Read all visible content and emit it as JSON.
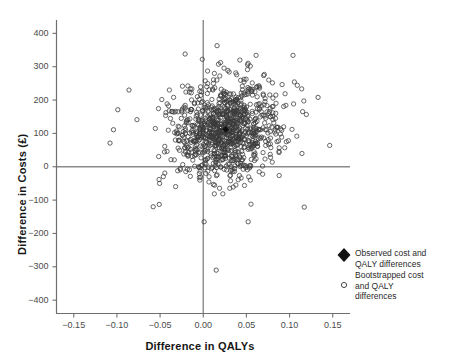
{
  "chart_data": {
    "type": "scatter",
    "title": "",
    "xlabel": "Difference in QALYs",
    "ylabel": "Difference in Costs (£)",
    "xlim": [
      -0.17,
      0.17
    ],
    "ylim": [
      -440,
      440
    ],
    "xticks": [
      -0.15,
      -0.1,
      -0.05,
      0.0,
      0.05,
      0.1,
      0.15
    ],
    "xticklabels": [
      "−0.15",
      "−0.10",
      "−0.05",
      "0.00",
      "0.05",
      "0.10",
      "0.15"
    ],
    "yticks": [
      -400,
      -300,
      -200,
      -100,
      0,
      100,
      200,
      300,
      400
    ],
    "yticklabels": [
      "−400",
      "−300",
      "−200",
      "−100",
      "0",
      "100",
      "200",
      "300",
      "400"
    ],
    "grid": false,
    "reference_lines": {
      "x": 0.0,
      "y": 0.0
    },
    "legend_position": "bottom-right",
    "series": [
      {
        "name": "Observed cost and QALY differences",
        "marker": "filled-diamond",
        "color": "#111111",
        "points": [
          {
            "x": 0.026,
            "y": 112
          }
        ]
      },
      {
        "name": "Bootstrapped cost and QALY differences",
        "marker": "open-circle",
        "color": "#3a3a3a",
        "n_points": 1000,
        "distribution": {
          "x_mean": 0.026,
          "x_sd": 0.032,
          "y_mean": 112,
          "y_sd": 72,
          "correlation": 0.1
        },
        "notable_points": [
          {
            "x": 0.015,
            "y": -310
          },
          {
            "x": 0.001,
            "y": -165
          },
          {
            "x": 0.052,
            "y": -165
          },
          {
            "x": -0.058,
            "y": -120
          },
          {
            "x": -0.051,
            "y": -113
          },
          {
            "x": 0.117,
            "y": -121
          },
          {
            "x": 0.016,
            "y": 363
          },
          {
            "x": -0.021,
            "y": 338
          },
          {
            "x": -0.086,
            "y": 230
          },
          {
            "x": -0.099,
            "y": 171
          },
          {
            "x": 0.133,
            "y": 208
          },
          {
            "x": -0.104,
            "y": 111
          },
          {
            "x": -0.108,
            "y": 71
          }
        ]
      }
    ]
  },
  "legend": {
    "entries": [
      {
        "marker": "filled-diamond",
        "lines": [
          "Observed cost and",
          "QALY differences"
        ]
      },
      {
        "marker": "open-circle",
        "lines": [
          "Bootstrapped cost",
          "and QALY",
          "differences"
        ]
      }
    ]
  },
  "colors": {
    "axis": "#8a8a8a",
    "text": "#1a1a1a",
    "tick_text": "#4b4b4b",
    "marker": "#3a3a3a",
    "observed": "#111111",
    "background": "#ffffff"
  }
}
